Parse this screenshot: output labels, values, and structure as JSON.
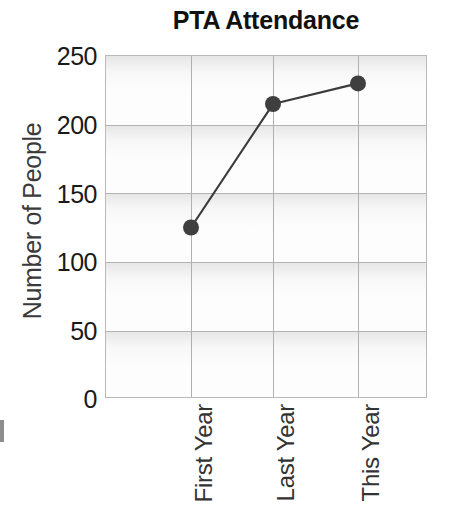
{
  "chart_data": {
    "type": "line",
    "title": "PTA Attendance",
    "xlabel": "",
    "ylabel": "Number of People",
    "categories": [
      "First Year",
      "Last Year",
      "This Year"
    ],
    "values": [
      125,
      215,
      230
    ],
    "series": [
      {
        "name": "Attendance",
        "values": [
          125,
          215,
          230
        ]
      }
    ],
    "ylim": [
      0,
      250
    ],
    "yticks": [
      0,
      50,
      100,
      150,
      200,
      250
    ],
    "ytick_labels": [
      "0",
      "50",
      "100",
      "150",
      "200",
      "250"
    ],
    "grid": true,
    "legend": false,
    "legend_position": "none",
    "marker": "circle",
    "line_color": "#3b3b3b",
    "marker_color": "#3f3f3f",
    "plot_background": "#fdfdfd",
    "grid_color": "#b3b3b3"
  },
  "figure": {
    "title": "PTA Attendance",
    "ylabel": "Number of People",
    "ytick_labels": [
      "250",
      "200",
      "150",
      "100",
      "50",
      "0"
    ],
    "xtick_labels": [
      "First Year",
      "Last Year",
      "This Year"
    ]
  }
}
